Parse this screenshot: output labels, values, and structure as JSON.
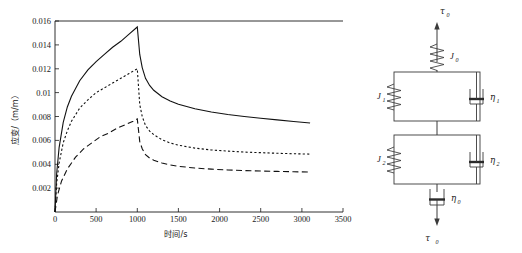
{
  "figure": {
    "title": "",
    "panels": [
      "creep-recovery-chart",
      "viscoelastic-model-diagram"
    ]
  },
  "chart_data": {
    "type": "line",
    "title": "",
    "xlabel": "时间/s",
    "ylabel": "应变/（m/m）",
    "xlim": [
      0,
      3500
    ],
    "ylim": [
      0,
      0.016
    ],
    "xticks": [
      0,
      500,
      1000,
      1500,
      2000,
      2500,
      3000,
      3500
    ],
    "xtick_labels": [
      "0",
      "500",
      "1000",
      "1500",
      "2000",
      "2500",
      "3000",
      "3500"
    ],
    "yticks": [
      0.002,
      0.004,
      0.006,
      0.008,
      0.01,
      0.012,
      0.014,
      0.016
    ],
    "ytick_labels": [
      "0.002",
      "0.004",
      "0.006",
      "0.008",
      "0.01",
      "0.012",
      "0.014",
      "0.016"
    ],
    "grid": false,
    "legend": "none",
    "annotations": [
      "load applied 0-1000 s, unloaded after 1000 s"
    ],
    "series": [
      {
        "name": "curve-solid",
        "style": "solid",
        "peak": {
          "x": 1000,
          "y": 0.0155
        },
        "end": {
          "x": 3100,
          "y": 0.00745
        },
        "x": [
          0,
          20,
          50,
          100,
          150,
          200,
          300,
          400,
          500,
          600,
          700,
          800,
          900,
          1000,
          1000,
          1030,
          1060,
          1100,
          1150,
          1200,
          1300,
          1400,
          1500,
          1700,
          1900,
          2100,
          2300,
          2500,
          2700,
          2900,
          3100
        ],
        "y": [
          0.0,
          0.0032,
          0.0054,
          0.0075,
          0.0088,
          0.0097,
          0.011,
          0.0119,
          0.0126,
          0.0132,
          0.0138,
          0.0143,
          0.0149,
          0.0155,
          0.0155,
          0.0132,
          0.0121,
          0.0112,
          0.0106,
          0.0102,
          0.00965,
          0.0093,
          0.00903,
          0.00865,
          0.00838,
          0.00817,
          0.008,
          0.00785,
          0.00772,
          0.00758,
          0.00745
        ]
      },
      {
        "name": "curve-dotted",
        "style": "dotted",
        "peak": {
          "x": 1000,
          "y": 0.012
        },
        "end": {
          "x": 3100,
          "y": 0.00485
        },
        "x": [
          0,
          20,
          50,
          100,
          150,
          200,
          300,
          400,
          500,
          600,
          700,
          800,
          900,
          1000,
          1000,
          1030,
          1060,
          1100,
          1150,
          1200,
          1300,
          1400,
          1500,
          1700,
          1900,
          2100,
          2300,
          2500,
          2700,
          2900,
          3100
        ],
        "y": [
          0.0,
          0.0024,
          0.0041,
          0.0058,
          0.0068,
          0.0076,
          0.0087,
          0.0094,
          0.01,
          0.0104,
          0.0108,
          0.0112,
          0.0116,
          0.012,
          0.012,
          0.009,
          0.008,
          0.00725,
          0.00678,
          0.00648,
          0.00605,
          0.00578,
          0.0056,
          0.00535,
          0.0052,
          0.0051,
          0.00502,
          0.00497,
          0.00492,
          0.00488,
          0.00485
        ]
      },
      {
        "name": "curve-dashed",
        "style": "dashed",
        "peak": {
          "x": 1000,
          "y": 0.0078
        },
        "end": {
          "x": 3100,
          "y": 0.00335
        },
        "x": [
          0,
          30,
          80,
          150,
          250,
          350,
          450,
          550,
          650,
          750,
          850,
          950,
          1000,
          1000,
          1030,
          1060,
          1100,
          1150,
          1200,
          1300,
          1400,
          1500,
          1700,
          1900,
          2100,
          2300,
          2500,
          2700,
          2900,
          3100
        ],
        "y": [
          0.0,
          0.0014,
          0.0026,
          0.0036,
          0.0046,
          0.0053,
          0.0058,
          0.0063,
          0.0066,
          0.007,
          0.0073,
          0.0076,
          0.0078,
          0.0078,
          0.0059,
          0.0053,
          0.0048,
          0.00452,
          0.00434,
          0.0041,
          0.00394,
          0.00383,
          0.00368,
          0.00359,
          0.00352,
          0.00347,
          0.00343,
          0.0034,
          0.00337,
          0.00335
        ]
      }
    ]
  },
  "model": {
    "name": "Burgers viscoelastic model",
    "labels": {
      "stress_top": "τ",
      "stress_top_sub": "0",
      "stress_bottom": "τ",
      "stress_bottom_sub": "0",
      "spring_top": "J",
      "spring_top_sub": "0",
      "spring_1": "J",
      "spring_1_sub": "1",
      "spring_2": "J",
      "spring_2_sub": "2",
      "dashpot_1": "η",
      "dashpot_1_sub": "1",
      "dashpot_2": "η",
      "dashpot_2_sub": "2",
      "dashpot_0": "η",
      "dashpot_0_sub": "0"
    },
    "elements": [
      "arrow-up-stress",
      "spring-J0",
      "kelvin-element-1",
      "kelvin-element-2",
      "dashpot-eta0",
      "arrow-down-stress"
    ]
  },
  "colors": {
    "curve": "#111111",
    "axis": "#1a1a1a",
    "wire": "#3a3a3a",
    "background": "#ffffff"
  }
}
